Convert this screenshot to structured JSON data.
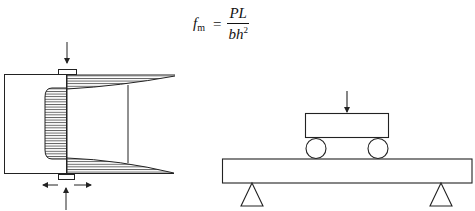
{
  "formula": {
    "lhs_symbol": "f",
    "lhs_subscript": "m",
    "equals": "=",
    "numerator": "PL",
    "denominator_base": "bh",
    "denominator_exponent": "2",
    "description": "Flexural strength f_m = PL / (b h^2)"
  },
  "figures": [
    {
      "id": "stress-distribution",
      "description": "Specimen section between loading plates with hatched stress distribution: compression block near loading line, tension/compression wedges at top and bottom, load arrows and lateral arrows"
    },
    {
      "id": "three-point-bending-rig",
      "description": "Loading block on two rollers resting on a beam supported by two triangular supports, with downward load arrow"
    }
  ],
  "colors": {
    "line": "#222222",
    "hatch": "#333333",
    "background": "#ffffff"
  }
}
